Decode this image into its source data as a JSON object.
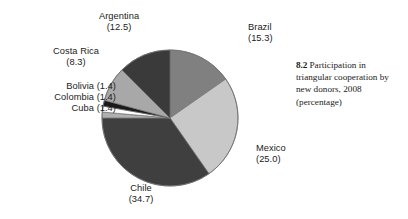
{
  "figure": {
    "caption_number": "8.2",
    "caption_text": "Participation in triangular cooperation by new donors, 2008 (percentage)"
  },
  "labels": {
    "argentina": {
      "name": "Argentina",
      "value": "(12.5)"
    },
    "brazil": {
      "name": "Brazil",
      "value": "(15.3)"
    },
    "costa_rica": {
      "name": "Costa Rica",
      "value": "(8.3)"
    },
    "bolivia": {
      "name": "Bolivia",
      "value": "(1.4)"
    },
    "colombia": {
      "name": "Colombia",
      "value": "(1.4)"
    },
    "cuba": {
      "name": "Cuba",
      "value": "(1.4)"
    },
    "mexico": {
      "name": "Mexico",
      "value": "(25.0)"
    },
    "chile": {
      "name": "Chile",
      "value": "(34.7)"
    }
  },
  "chart_data": {
    "type": "pie",
    "title": "Participation in triangular cooperation by new donors, 2008 (percentage)",
    "xlabel": "",
    "ylabel": "",
    "units": "percentage",
    "legend": "none (direct slice labels with leader callouts)",
    "grid": false,
    "start_angle_deg": 0,
    "direction": "clockwise",
    "total": 100.0,
    "categories": [
      "Brazil",
      "Mexico",
      "Chile",
      "Cuba",
      "Colombia",
      "Bolivia",
      "Costa Rica",
      "Argentina"
    ],
    "values": [
      15.3,
      25.0,
      34.7,
      1.4,
      1.4,
      1.4,
      8.3,
      12.5
    ],
    "colors": [
      "#808080",
      "#c8c8c8",
      "#3f3f3f",
      "#b0b0b0",
      "#ffffff",
      "#1a1a1a",
      "#a8a8a8",
      "#3a3a3a"
    ],
    "slices": [
      {
        "label": "Brazil",
        "value": 15.3,
        "color": "#808080"
      },
      {
        "label": "Mexico",
        "value": 25.0,
        "color": "#c8c8c8"
      },
      {
        "label": "Chile",
        "value": 34.7,
        "color": "#3f3f3f"
      },
      {
        "label": "Cuba",
        "value": 1.4,
        "color": "#b0b0b0"
      },
      {
        "label": "Colombia",
        "value": 1.4,
        "color": "#ffffff"
      },
      {
        "label": "Bolivia",
        "value": 1.4,
        "color": "#1a1a1a"
      },
      {
        "label": "Costa Rica",
        "value": 8.3,
        "color": "#a8a8a8"
      },
      {
        "label": "Argentina",
        "value": 12.5,
        "color": "#3a3a3a"
      }
    ]
  },
  "style": {
    "background": "#ffffff",
    "text_color": "#1b1b1b",
    "slice_outline": "#6f6f6f"
  }
}
